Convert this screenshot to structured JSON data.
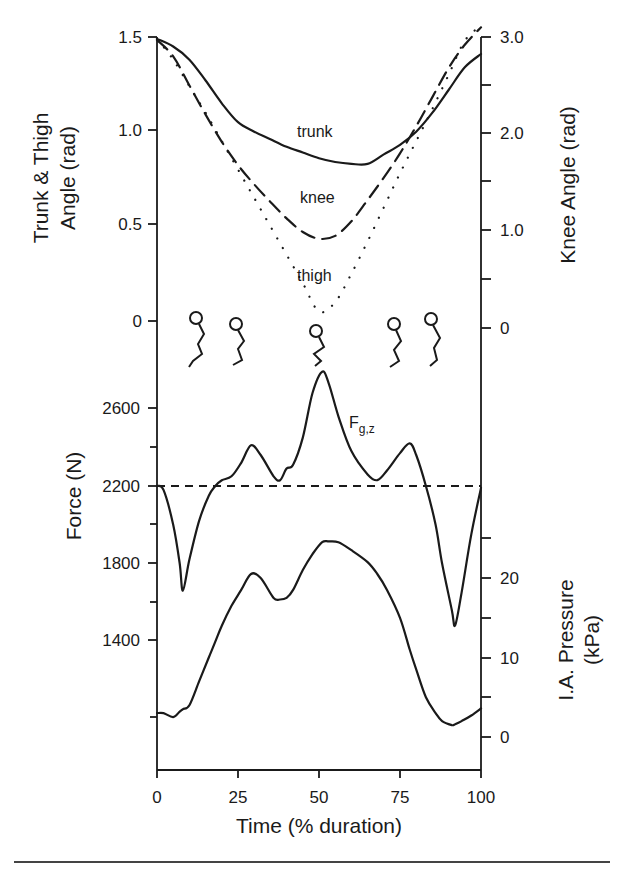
{
  "chart_data": [
    {
      "id": "angles",
      "type": "line",
      "title": "",
      "xlabel": "Time (% duration)",
      "ylabel": "Trunk & Thigh Angle (rad)",
      "ylabel_lines": [
        "Trunk & Thigh",
        "Angle (rad)"
      ],
      "ylabel_right": "Knee Angle (rad)",
      "xlim": [
        0,
        100
      ],
      "ylim": [
        0,
        1.5
      ],
      "ylim_right": [
        0,
        3.0
      ],
      "yticks": [
        0,
        0.5,
        1.0,
        1.5
      ],
      "ytick_labels": [
        "0",
        "0.5",
        "1.0",
        "1.5"
      ],
      "yticks_right": [
        0,
        1.0,
        2.0,
        3.0
      ],
      "ytick_labels_right": [
        "0",
        "1.0",
        "2.0",
        "3.0"
      ],
      "yticks_right_minor": [
        0.5,
        1.5,
        2.5
      ],
      "grid": false,
      "legend": "inline labels",
      "x": [
        0,
        5,
        10,
        15,
        20,
        25,
        30,
        35,
        40,
        45,
        50,
        55,
        60,
        65,
        70,
        75,
        80,
        85,
        90,
        95,
        100
      ],
      "series": [
        {
          "name": "trunk",
          "axis": "left",
          "style": "solid",
          "values": [
            1.49,
            1.45,
            1.38,
            1.27,
            1.15,
            1.05,
            1.0,
            0.96,
            0.92,
            0.89,
            0.86,
            0.84,
            0.83,
            0.83,
            0.88,
            0.93,
            1.0,
            1.1,
            1.22,
            1.34,
            1.41
          ]
        },
        {
          "name": "knee",
          "axis": "right",
          "style": "dashed",
          "values": [
            2.97,
            2.8,
            2.5,
            2.2,
            1.92,
            1.68,
            1.48,
            1.3,
            1.13,
            0.99,
            0.92,
            0.95,
            1.1,
            1.32,
            1.55,
            1.8,
            2.08,
            2.38,
            2.68,
            2.92,
            3.1
          ]
        },
        {
          "name": "thigh",
          "axis": "left",
          "style": "dotted",
          "values": [
            1.49,
            1.38,
            1.24,
            1.1,
            0.95,
            0.8,
            0.65,
            0.5,
            0.35,
            0.2,
            0.05,
            0.1,
            0.25,
            0.42,
            0.6,
            0.78,
            0.95,
            1.12,
            1.3,
            1.48,
            1.56
          ]
        }
      ],
      "annotations": [
        {
          "text": "trunk",
          "x": 48,
          "y": 0.95
        },
        {
          "text": "knee",
          "x": 51,
          "y": 0.6
        },
        {
          "text": "thigh",
          "x": 50,
          "y": 0.24
        }
      ],
      "figures": "five stick-figure icons showing squat posture at ~13%, ~25%, ~50%, ~75%, ~85% of duration"
    },
    {
      "id": "force_pressure",
      "type": "line",
      "title": "",
      "xlabel": "Time (% duration)",
      "ylabel": "Force (N)",
      "ylabel_right": "I.A. Pressure (kPa)",
      "ylabel_right_lines": [
        "I.A. Pressure",
        "(kPa)"
      ],
      "xlim": [
        0,
        100
      ],
      "xticks": [
        0,
        25,
        50,
        75,
        100
      ],
      "xtick_labels": [
        "0",
        "25",
        "50",
        "75",
        "100"
      ],
      "yticks": [
        1400,
        1800,
        2200,
        2600
      ],
      "ytick_labels": [
        "1400",
        "1800",
        "2200",
        "2600"
      ],
      "yticks_minor": [
        1000,
        1600,
        2000,
        2400
      ],
      "yticks_right": [
        0,
        10,
        20
      ],
      "ytick_labels_right": [
        "0",
        "10",
        "20"
      ],
      "yticks_right_minor": [
        5,
        15,
        25
      ],
      "grid": false,
      "reference_line": {
        "y": 2200,
        "style": "dashed",
        "axis": "left"
      },
      "x": [
        0,
        2,
        5,
        7,
        8,
        10,
        13,
        16,
        18,
        20,
        23,
        26,
        29,
        32,
        36,
        38,
        40,
        42,
        45,
        48,
        51,
        53,
        56,
        60,
        65,
        68,
        71,
        75,
        78,
        80,
        83,
        86,
        88,
        91,
        92,
        94,
        97,
        100
      ],
      "series": [
        {
          "name": "F_g,z",
          "axis": "left",
          "style": "solid",
          "values": [
            2200,
            2180,
            2000,
            1800,
            1660,
            1820,
            2020,
            2150,
            2200,
            2230,
            2250,
            2320,
            2410,
            2360,
            2250,
            2230,
            2290,
            2310,
            2450,
            2680,
            2790,
            2730,
            2560,
            2380,
            2260,
            2230,
            2280,
            2370,
            2420,
            2360,
            2200,
            2000,
            1800,
            1560,
            1480,
            1650,
            1950,
            2190
          ]
        },
        {
          "name": "I.A. Pressure",
          "axis": "right",
          "style": "solid",
          "values": [
            3.0,
            3.0,
            2.5,
            3.2,
            3.5,
            4.0,
            7.0,
            10.0,
            12.0,
            14.0,
            16.5,
            18.5,
            20.5,
            20.0,
            17.5,
            17.3,
            17.5,
            18.5,
            21.0,
            23.0,
            24.5,
            24.6,
            24.5,
            23.5,
            22.0,
            20.5,
            18.5,
            15.0,
            11.0,
            8.5,
            5.0,
            3.0,
            2.0,
            1.5,
            1.6,
            2.0,
            2.7,
            3.6
          ]
        }
      ],
      "annotations": [
        {
          "text": "F",
          "subscript": "g,z",
          "x": 58,
          "y": 2560
        }
      ]
    }
  ],
  "figure": {
    "top_panel": {
      "left_axis_title_lines": [
        "Trunk & Thigh",
        "Angle (rad)"
      ],
      "right_axis_title": "Knee Angle (rad)",
      "left_tick_labels": [
        "1.5",
        "1.0",
        "0.5",
        "0"
      ],
      "right_tick_labels": [
        "3.0",
        "2.0",
        "1.0",
        "0"
      ],
      "labels": {
        "trunk": "trunk",
        "knee": "knee",
        "thigh": "thigh"
      }
    },
    "bottom_panel": {
      "left_axis_title": "Force (N)",
      "right_axis_title_lines": [
        "I.A. Pressure",
        "(kPa)"
      ],
      "left_tick_labels": [
        "2600",
        "2200",
        "1800",
        "1400"
      ],
      "right_tick_labels": [
        "20",
        "10",
        "0"
      ],
      "force_label_main": "F",
      "force_label_sub": "g,z"
    },
    "x_axis": {
      "tick_labels": [
        "0",
        "25",
        "50",
        "75",
        "100"
      ],
      "title": "Time (% duration)"
    }
  }
}
